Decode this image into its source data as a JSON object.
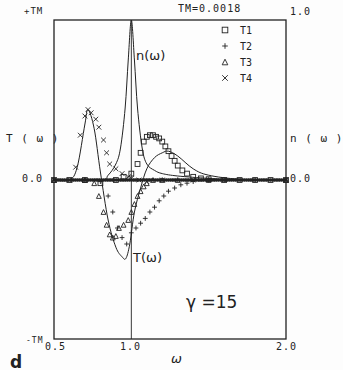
{
  "chart_data": {
    "type": "line",
    "panel_label": "d",
    "title": "TM=0.0018",
    "xlabel": "ω",
    "ylabel_left": "T ( ω )",
    "ylabel_right": "n ( ω )",
    "xlim": [
      0.5,
      2.0
    ],
    "ylim_left": [
      "-TM",
      "+TM"
    ],
    "ylim_right": [
      0.0,
      1.0
    ],
    "x_ticks": [
      "0.5",
      "1.0",
      "2.0"
    ],
    "y_left_ticks": {
      "top": "+TM",
      "zero": "0.0",
      "bottom": "-TM"
    },
    "y_right_ticks": {
      "top": "1.0",
      "zero": "0.0"
    },
    "grid": false,
    "legend_position": "upper right",
    "annotations": {
      "n_curve": "n(ω)",
      "t_curve": "T(ω)",
      "gamma": "γ =15"
    },
    "vertical_line_at": 1.0,
    "series": [
      {
        "name": "n(ω)",
        "kind": "solid",
        "x": [
          0.5,
          0.8,
          0.85,
          0.9,
          0.93,
          0.96,
          0.98,
          1.0,
          1.02,
          1.04,
          1.07,
          1.1,
          1.15,
          1.2,
          1.3,
          1.5,
          1.7,
          2.0
        ],
        "y": [
          0.0,
          0.0,
          0.03,
          0.1,
          0.2,
          0.45,
          0.75,
          1.0,
          0.75,
          0.45,
          0.2,
          0.1,
          0.06,
          0.04,
          0.025,
          0.01,
          0.0,
          0.0
        ]
      },
      {
        "name": "T(ω)",
        "kind": "solid",
        "x": [
          0.5,
          0.6,
          0.65,
          0.7,
          0.72,
          0.76,
          0.8,
          0.85,
          0.9,
          0.94,
          0.965,
          0.99,
          1.02,
          1.06,
          1.1,
          1.15,
          1.2,
          1.24,
          1.3,
          1.4,
          1.5,
          1.7,
          2.0
        ],
        "y": [
          0.0,
          0.0,
          0.08,
          0.35,
          0.44,
          0.32,
          0.05,
          -0.25,
          -0.42,
          -0.48,
          -0.49,
          -0.4,
          -0.2,
          -0.05,
          0.07,
          0.14,
          0.17,
          0.18,
          0.15,
          0.07,
          0.03,
          0.005,
          0.0
        ]
      },
      {
        "name": "T1",
        "marker": "square",
        "x": [
          0.5,
          0.6,
          0.7,
          0.8,
          0.9,
          0.95,
          1.0,
          1.04,
          1.06,
          1.08,
          1.1,
          1.12,
          1.14,
          1.16,
          1.18,
          1.2,
          1.22,
          1.24,
          1.26,
          1.28,
          1.3,
          1.33,
          1.36,
          1.4,
          1.45,
          1.5,
          1.6,
          1.7,
          1.8,
          1.9,
          2.0
        ],
        "y": [
          0.0,
          0.0,
          0.0,
          -0.02,
          0.0,
          0.02,
          0.04,
          0.1,
          0.17,
          0.24,
          0.27,
          0.28,
          0.28,
          0.27,
          0.26,
          0.24,
          0.21,
          0.18,
          0.15,
          0.12,
          0.09,
          0.06,
          0.04,
          0.02,
          0.01,
          0.005,
          0.0,
          0.0,
          0.0,
          0.0,
          0.0
        ]
      },
      {
        "name": "T2",
        "marker": "plus",
        "x": [
          0.5,
          0.7,
          0.8,
          0.85,
          0.88,
          0.91,
          0.94,
          0.97,
          1.0,
          1.03,
          1.06,
          1.09,
          1.12,
          1.15,
          1.18,
          1.21,
          1.24,
          1.28,
          1.32,
          1.36,
          1.4,
          1.5,
          1.6,
          1.8,
          2.0
        ],
        "y": [
          0.0,
          0.0,
          -0.01,
          -0.1,
          -0.2,
          -0.3,
          -0.36,
          -0.4,
          -0.33,
          -0.3,
          -0.27,
          -0.24,
          -0.2,
          -0.17,
          -0.13,
          -0.1,
          -0.07,
          -0.05,
          -0.03,
          -0.02,
          -0.01,
          0.0,
          0.0,
          0.0,
          0.0
        ]
      },
      {
        "name": "T3",
        "marker": "triangle",
        "x": [
          0.5,
          0.7,
          0.76,
          0.79,
          0.82,
          0.84,
          0.86,
          0.88,
          0.9,
          0.92,
          0.95,
          0.98,
          1.0,
          1.02,
          1.04,
          1.06,
          1.08,
          1.1,
          1.14,
          1.2,
          1.3,
          1.5,
          2.0
        ],
        "y": [
          0.0,
          0.0,
          -0.02,
          -0.1,
          -0.2,
          -0.28,
          -0.34,
          -0.36,
          -0.35,
          -0.3,
          -0.28,
          -0.25,
          -0.2,
          -0.15,
          -0.1,
          -0.07,
          -0.04,
          -0.02,
          0.0,
          0.0,
          0.0,
          0.0,
          0.0
        ]
      },
      {
        "name": "T4",
        "marker": "x",
        "x": [
          0.5,
          0.6,
          0.64,
          0.67,
          0.7,
          0.72,
          0.74,
          0.77,
          0.79,
          0.82,
          0.84,
          0.86,
          0.9,
          0.94,
          0.98,
          1.0,
          1.05,
          1.1,
          1.2,
          1.4,
          1.6,
          2.0
        ],
        "y": [
          0.0,
          0.0,
          0.08,
          0.28,
          0.4,
          0.44,
          0.42,
          0.38,
          0.33,
          0.25,
          0.17,
          0.1,
          0.07,
          0.04,
          0.02,
          0.01,
          0.0,
          -0.01,
          0.0,
          0.0,
          0.0,
          0.0
        ]
      }
    ]
  },
  "legend": [
    {
      "label": "T1",
      "marker": "square"
    },
    {
      "label": "T2",
      "marker": "plus"
    },
    {
      "label": "T3",
      "marker": "triangle"
    },
    {
      "label": "T4",
      "marker": "x"
    }
  ]
}
